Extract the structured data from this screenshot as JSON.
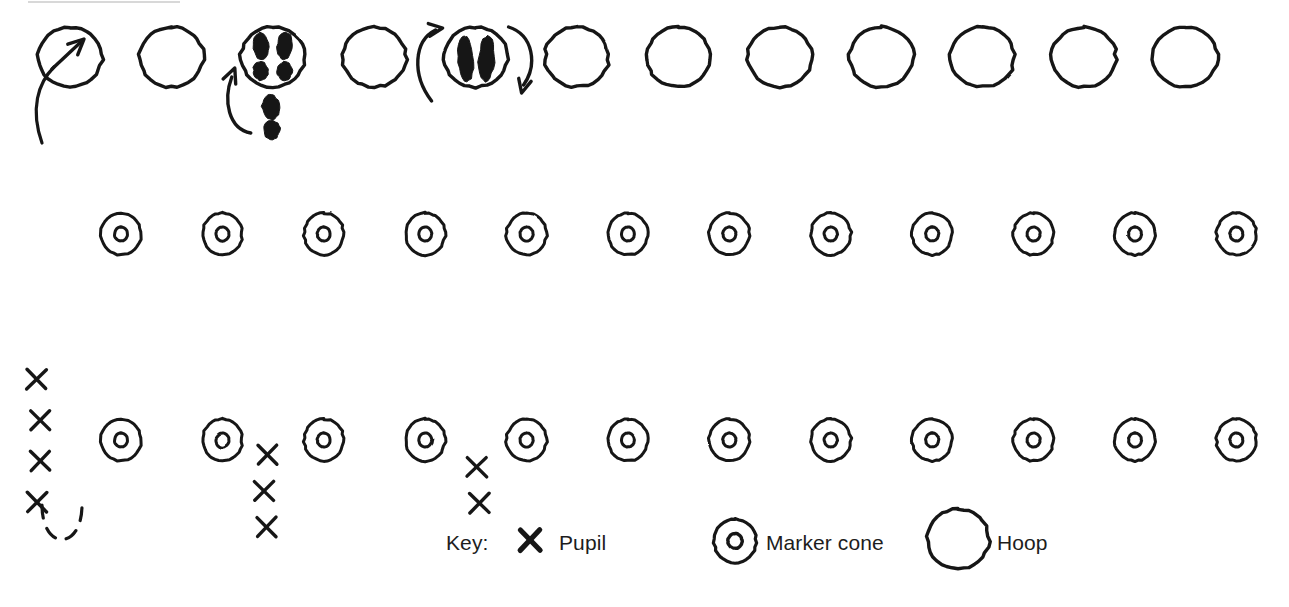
{
  "diagram": {
    "type": "sports-drill-diagram",
    "stroke_color": "#161616",
    "background_color": "#ffffff",
    "canvas": {
      "width": 1289,
      "height": 607
    }
  },
  "legend": {
    "label": "Key:",
    "items": [
      {
        "icon": "cross-icon",
        "label": "Pupil"
      },
      {
        "icon": "marker-cone-icon",
        "label": "Marker cone"
      },
      {
        "icon": "hoop-icon",
        "label": "Hoop"
      }
    ]
  },
  "rows": {
    "hoops": {
      "count": 12,
      "y": 57,
      "x_start": 70,
      "x_step": 101.4,
      "rx": 32,
      "ry": 30,
      "stroke_width": 3.4
    },
    "cones_middle": {
      "count": 12,
      "y": 234,
      "x_start": 121,
      "x_step": 101.4,
      "rx": 20,
      "ry": 21,
      "inner_rx": 6.5,
      "inner_ry": 7,
      "stroke_width": 3
    },
    "cones_bottom": {
      "count": 12,
      "y": 440,
      "x_start": 121,
      "x_step": 101.4,
      "rx": 20,
      "ry": 21,
      "inner_rx": 6.5,
      "inner_ry": 7,
      "stroke_width": 3
    }
  },
  "footprint_marks": [
    {
      "hoop_index": 2,
      "kind": "feet-apart-four-prints",
      "note": "two feet landing wide inside hoop"
    },
    {
      "hoop_index": 2,
      "kind": "single-foot-outside-below",
      "note": "take-off foot below hoop"
    },
    {
      "hoop_index": 4,
      "kind": "feet-together-two-prints",
      "note": "two feet together inside hoop"
    }
  ],
  "arrows": [
    {
      "name": "run-in-arrow",
      "hoop_index": 0,
      "kind": "curved-up-right"
    },
    {
      "name": "hop-arrow",
      "hoop_index": 2,
      "kind": "curved-up-left"
    },
    {
      "name": "rotate-left-arrow",
      "hoop_index": 4,
      "kind": "curved-up"
    },
    {
      "name": "rotate-right-arrow",
      "hoop_index": 4,
      "kind": "curved-down"
    }
  ],
  "lanes": [
    {
      "name": "lane-left-outer",
      "x": 42,
      "y_top": 75,
      "y_bottom": 505,
      "style": "dashed"
    },
    {
      "name": "lane-left-inner",
      "x": 82,
      "y_top": 70,
      "y_bottom": 505,
      "style": "dashed"
    },
    {
      "name": "lane-loop-bottom",
      "kind": "u-turn",
      "x1": 42,
      "x2": 82,
      "y": 505,
      "style": "dashed"
    },
    {
      "name": "lane-column-two",
      "x": 264,
      "y_top": 138,
      "y_bottom": 425,
      "style": "dashed"
    },
    {
      "name": "lane-column-three",
      "x": 465,
      "y_top": 140,
      "y_bottom": 452,
      "style": "dashed"
    }
  ],
  "pupil_groups": [
    {
      "name": "queue-lane-one",
      "count": 4,
      "x": 40,
      "y_start": 379,
      "y_step": 41,
      "size": 19
    },
    {
      "name": "queue-lane-two",
      "count": 3,
      "x": 264,
      "y_start": 455,
      "y_step": 36,
      "size": 19
    },
    {
      "name": "queue-lane-three",
      "count": 2,
      "x": 477,
      "y_start": 467,
      "y_step": 36,
      "size": 19
    }
  ],
  "legend_marks": {
    "cross": {
      "x": 530,
      "y": 540,
      "size": 20
    },
    "cone": {
      "x": 735,
      "y": 541,
      "rx": 21,
      "ry": 22,
      "inner_rx": 7,
      "inner_ry": 7.5
    },
    "hoop": {
      "x": 958,
      "y": 539,
      "rx": 31,
      "ry": 30
    }
  },
  "top_edge_hairline": {
    "y": 2,
    "x1": 28,
    "x2": 180,
    "visible": true
  }
}
